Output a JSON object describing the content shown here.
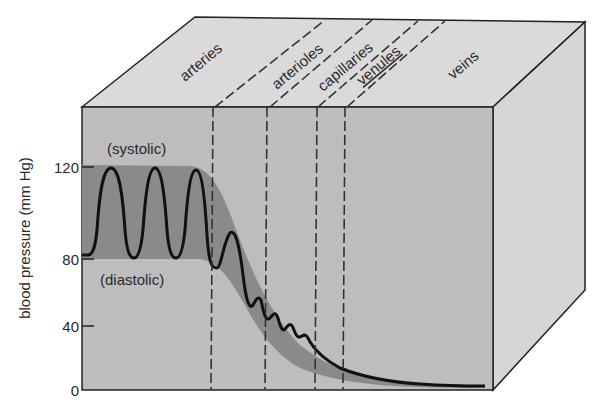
{
  "diagram": {
    "y_axis": {
      "label": "blood pressure (mm Hg)",
      "ticks": [
        {
          "value": "120",
          "y": 167
        },
        {
          "value": "80",
          "y": 259
        },
        {
          "value": "40",
          "y": 326
        },
        {
          "value": "0",
          "y": 390
        }
      ]
    },
    "annotations": {
      "systolic": "(systolic)",
      "diastolic": "(diastolic)"
    },
    "vessels": [
      {
        "label": "arteries"
      },
      {
        "label": "arterioles"
      },
      {
        "label": "capillaries"
      },
      {
        "label": "venules"
      },
      {
        "label": "veins"
      }
    ],
    "colors": {
      "front_face": "#bdbdbd",
      "top_face": "#dadada",
      "side_face": "#d6d6d6",
      "pressure_band": "#8a8a8a",
      "curve": "#111111",
      "edge": "#222222"
    }
  }
}
